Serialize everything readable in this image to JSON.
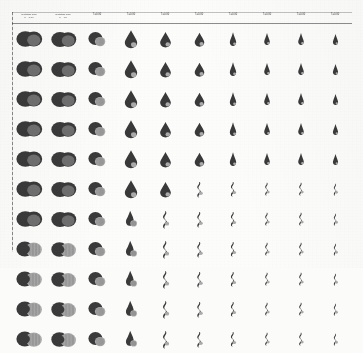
{
  "figure": {
    "title": "",
    "background_color": "#fcfcfb",
    "ink_color": "#3e3e3e",
    "columns": 10,
    "rows": 11,
    "header": [
      {
        "line1": "Rotating fluid",
        "line2": "n = 0.00"
      },
      {
        "line1": "Rotating fluid",
        "line2": "n = .00"
      },
      {
        "line1": "T=0.00",
        "line2": ""
      },
      {
        "line1": "T=0.00",
        "line2": ""
      },
      {
        "line1": "T=0.00",
        "line2": ""
      },
      {
        "line1": "T=0.00",
        "line2": ""
      },
      {
        "line1": "T=0.00",
        "line2": ""
      },
      {
        "line1": "T=0.00",
        "line2": ""
      },
      {
        "line1": "T=0.00",
        "line2": ""
      },
      {
        "line1": "T=0.00",
        "line2": ""
      }
    ]
  },
  "chart_data": {
    "type": "table",
    "title": "",
    "xlabel": "",
    "ylabel": "",
    "categories": [
      "c1",
      "c2",
      "c3",
      "c4",
      "c5",
      "c6",
      "c7",
      "c8",
      "c9",
      "c10"
    ],
    "rows": [
      "r1",
      "r2",
      "r3",
      "r4",
      "r5",
      "r6",
      "r7",
      "r8",
      "r9",
      "r10",
      "r11"
    ],
    "cell_morphology": [
      [
        "lobed",
        "lobed",
        "round",
        "teardrop",
        "teardrop",
        "teardrop",
        "cone",
        "cone",
        "cone",
        "cone"
      ],
      [
        "lobed",
        "lobed",
        "round",
        "teardrop",
        "teardrop",
        "teardrop",
        "cone",
        "cone",
        "cone",
        "cone"
      ],
      [
        "lobed",
        "lobed",
        "round",
        "teardrop",
        "teardrop",
        "teardrop",
        "cone",
        "cone",
        "cone",
        "cone"
      ],
      [
        "lobed",
        "lobed",
        "round",
        "teardrop",
        "teardrop",
        "teardrop",
        "cone",
        "cone",
        "cone",
        "cone"
      ],
      [
        "lobed",
        "lobed",
        "round",
        "teardrop",
        "teardrop",
        "teardrop",
        "cone",
        "cone",
        "cone",
        "cone"
      ],
      [
        "lobed",
        "lobed",
        "round",
        "teardrop",
        "teardrop",
        "spiral",
        "spiral",
        "spiral",
        "spiral",
        "spiral"
      ],
      [
        "lobed",
        "lobed",
        "round",
        "drop",
        "spiral",
        "spiral",
        "spiral",
        "spiral",
        "spiral",
        "spiral"
      ],
      [
        "striped",
        "striped",
        "round",
        "drop",
        "spiral",
        "spiral",
        "spiral",
        "spiral",
        "spiral",
        "spiral"
      ],
      [
        "striped",
        "striped",
        "round",
        "drop",
        "spiral",
        "spiral",
        "spiral",
        "spiral",
        "spiral",
        "spiral"
      ],
      [
        "striped",
        "striped",
        "round",
        "drop",
        "spiral",
        "spiral",
        "spiral",
        "spiral",
        "spiral",
        "spiral"
      ],
      [
        "striped",
        "striped",
        "round",
        "drop",
        "spiral",
        "spiral",
        "spiral",
        "spiral",
        "spiral",
        "spiral"
      ]
    ],
    "scale": [
      1.0,
      0.97,
      0.88,
      0.72,
      0.64,
      0.58,
      0.52,
      0.48,
      0.45,
      0.42
    ]
  }
}
